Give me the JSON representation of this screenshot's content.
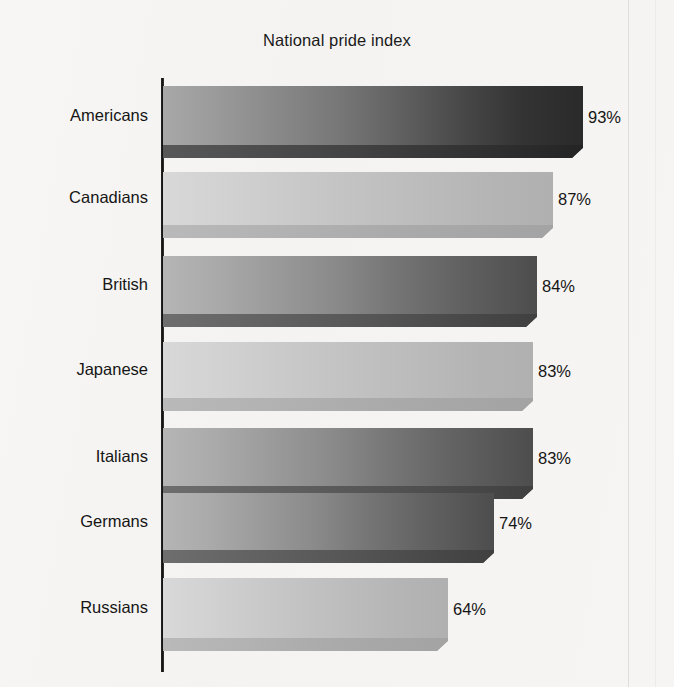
{
  "chart_data": {
    "type": "bar",
    "orientation": "horizontal",
    "title": "National pride index",
    "xlabel": "",
    "ylabel": "",
    "grid": false,
    "legend": null,
    "value_suffix": "%",
    "xlim": [
      0,
      100
    ],
    "categories": [
      "Americans",
      "Canadians",
      "British",
      "Japanese",
      "Italians",
      "Germans",
      "Russians"
    ],
    "values": [
      93,
      87,
      84,
      83,
      83,
      74,
      64
    ],
    "value_labels": [
      "93%",
      "87%",
      "84%",
      "83%",
      "83%",
      "74%",
      "64%"
    ],
    "bars": [
      {
        "category": "Americans",
        "value": 93,
        "label": "93%",
        "tone": "tone-dark"
      },
      {
        "category": "Canadians",
        "value": 87,
        "label": "87%",
        "tone": "tone-light"
      },
      {
        "category": "British",
        "value": 84,
        "label": "84%",
        "tone": "tone-mid"
      },
      {
        "category": "Japanese",
        "value": 83,
        "label": "83%",
        "tone": "tone-light"
      },
      {
        "category": "Italians",
        "value": 83,
        "label": "83%",
        "tone": "tone-mid"
      },
      {
        "category": "Germans",
        "value": 74,
        "label": "74%",
        "tone": "tone-mid"
      },
      {
        "category": "Russians",
        "value": 64,
        "label": "64%",
        "tone": "tone-light"
      }
    ],
    "colors": {
      "background": "#f6f5f3",
      "axis": "#111111",
      "text": "#151515",
      "bar_dark": "#2a2a2a",
      "bar_mid": "#4d4d4d",
      "bar_light": "#b0b0b0"
    }
  },
  "layout": {
    "axis_x": 163,
    "axis_top": 78,
    "axis_bottom": 672,
    "bar_rows": [
      {
        "top": 86,
        "height": 72,
        "end_x": 583,
        "label_y": 106,
        "value_x": 588,
        "value_y": 108
      },
      {
        "top": 172,
        "height": 66,
        "end_x": 553,
        "label_y": 188,
        "value_x": 558,
        "value_y": 190
      },
      {
        "top": 256,
        "height": 71,
        "end_x": 537,
        "label_y": 275,
        "value_x": 542,
        "value_y": 277
      },
      {
        "top": 342,
        "height": 69,
        "end_x": 533,
        "label_y": 360,
        "value_x": 538,
        "value_y": 362
      },
      {
        "top": 428,
        "height": 71,
        "end_x": 533,
        "label_y": 447,
        "value_x": 538,
        "value_y": 449
      },
      {
        "top": 493,
        "height": 70,
        "end_x": 494,
        "label_y": 512,
        "value_x": 499,
        "value_y": 514
      },
      {
        "top": 578,
        "height": 73,
        "end_x": 448,
        "label_y": 598,
        "value_x": 453,
        "value_y": 600
      }
    ]
  }
}
